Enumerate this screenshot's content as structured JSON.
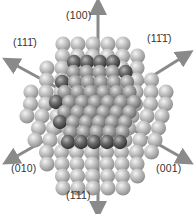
{
  "figure": {
    "type": "crystal-nanoparticle-diagram",
    "colors": {
      "background": "#ffffff",
      "outer_sphere": "#b5b5b5",
      "inner_sphere": "#8e8e8e",
      "edge_sphere": "#4a4a4a",
      "arrow": "#8a8a8a",
      "label": "#333333"
    },
    "arrows": [
      {
        "id": "100",
        "label_parts": [
          "(",
          "1",
          "0",
          "0",
          ")"
        ],
        "overline": [],
        "x1": 98,
        "y1": 90,
        "x2": 98,
        "y2": 6
      },
      {
        "id": "11-1",
        "label_parts": [
          "(",
          "1",
          "1",
          "1",
          ")"
        ],
        "overline": [
          3
        ],
        "x1": 98,
        "y1": 110,
        "x2": 10,
        "y2": 62
      },
      {
        "id": "1-11",
        "label_parts": [
          "(",
          "1",
          "1",
          "1",
          ")"
        ],
        "overline": [
          2,
          3
        ],
        "x1": 98,
        "y1": 110,
        "x2": 186,
        "y2": 55
      },
      {
        "id": "010",
        "label_parts": [
          "(",
          "0",
          "1",
          "0",
          ")"
        ],
        "overline": [],
        "x1": 98,
        "y1": 110,
        "x2": 10,
        "y2": 160
      },
      {
        "id": "001",
        "label_parts": [
          "(",
          "0",
          "0",
          "1",
          ")"
        ],
        "overline": [],
        "x1": 98,
        "y1": 110,
        "x2": 186,
        "y2": 160
      },
      {
        "id": "-111",
        "label_parts": [
          "(",
          "1",
          "1",
          "1",
          ")"
        ],
        "overline": [
          1
        ],
        "x1": 98,
        "y1": 130,
        "x2": 98,
        "y2": 210
      }
    ],
    "labels": [
      {
        "text": "(100)",
        "x": 66,
        "y": 16
      },
      {
        "text": "(111̄)",
        "x": 14,
        "y": 42
      },
      {
        "text": "(11̄1̄)",
        "x": 146,
        "y": 38
      },
      {
        "text": "(010)",
        "x": 12,
        "y": 169
      },
      {
        "text": "(001)",
        "x": 157,
        "y": 169
      },
      {
        "text": "(1̄11)",
        "x": 66,
        "y": 195
      }
    ]
  }
}
